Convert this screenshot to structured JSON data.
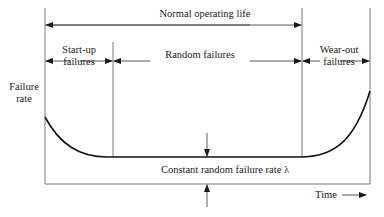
{
  "diagram": {
    "y_axis_label_line1": "Failure",
    "y_axis_label_line2": "rate",
    "x_axis_label": "Time",
    "span_top": "Normal operating life",
    "phases": [
      {
        "line1": "Start-up",
        "line2": "failures"
      },
      {
        "line1": "Random failures",
        "line2": ""
      },
      {
        "line1": "Wear-out",
        "line2": "failures"
      }
    ],
    "constant_rate_label": "Constant random failure rate λ"
  }
}
